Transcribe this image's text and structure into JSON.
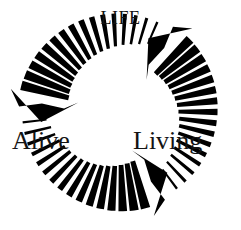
{
  "diagram": {
    "background_color": "#ffffff",
    "arrow_color": "#000000",
    "text_color": "#141414",
    "nodes": [
      {
        "id": "life",
        "label": "Life",
        "position": "top",
        "style": "small-caps"
      },
      {
        "id": "alive",
        "label": "Alive",
        "position": "bottom-left",
        "style": "normal"
      },
      {
        "id": "living",
        "label": "Living",
        "position": "bottom-right",
        "style": "normal"
      }
    ],
    "arrows": [
      {
        "id": "life-to-alive",
        "from": "life",
        "to": "alive",
        "direction": "counter-clockwise",
        "shape": "curved-segmented-tapered",
        "segments": 16,
        "head": "solid-triangle",
        "head_points": "down-left",
        "tail_start_deg": -66,
        "head_end_deg": -186
      },
      {
        "id": "alive-to-living",
        "from": "alive",
        "to": "living",
        "direction": "counter-clockwise",
        "shape": "curved-segmented-tapered",
        "segments": 16,
        "head": "solid-triangle",
        "head_points": "up-right",
        "tail_start_deg": 54,
        "head_end_deg": -66
      },
      {
        "id": "living-to-life",
        "from": "living",
        "to": "life",
        "direction": "counter-clockwise",
        "shape": "curved-segmented-tapered",
        "segments": 16,
        "head": "solid-triangle",
        "head_points": "up-left",
        "tail_start_deg": 174,
        "head_end_deg": 54
      }
    ],
    "geometry": {
      "center_x": 119,
      "center_y": 111,
      "inner_radius": 52,
      "outer_radius": 101
    }
  }
}
